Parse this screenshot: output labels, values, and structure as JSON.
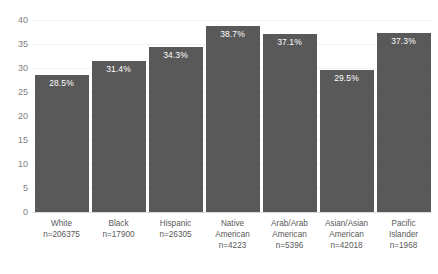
{
  "chart_data": {
    "type": "bar",
    "title": "",
    "xlabel": "",
    "ylabel": "",
    "ylim": [
      0,
      40
    ],
    "ytick_step": 5,
    "yticks": [
      "0",
      "5",
      "10",
      "15",
      "20",
      "25",
      "30",
      "35",
      "40"
    ],
    "grid": true,
    "legend": false,
    "bar_color": "#595959",
    "label_color": "#FFFFFF",
    "axis_text_color": "#808080",
    "gridline_color": "#F2F2F2",
    "categories": [
      "White",
      "Black",
      "Hispanic",
      "Native American",
      "Arab/Arab American",
      "Asian/Asian American",
      "Pacific Islander"
    ],
    "category_lines": [
      "White",
      "Black",
      "Hispanic",
      "Native\nAmerican",
      "Arab/Arab\nAmerican",
      "Asian/Asian\nAmerican",
      "Pacific\nIslander"
    ],
    "counts": [
      "n=206375",
      "n=17900",
      "n=26305",
      "n=4223",
      "n=5396",
      "n=42018",
      "n=1968"
    ],
    "values": [
      28.5,
      31.4,
      34.3,
      38.7,
      37.1,
      29.5,
      37.3
    ],
    "data_labels": [
      "28.5%",
      "31.4%",
      "34.3%",
      "38.7%",
      "37.1%",
      "29.5%",
      "37.3%"
    ]
  }
}
